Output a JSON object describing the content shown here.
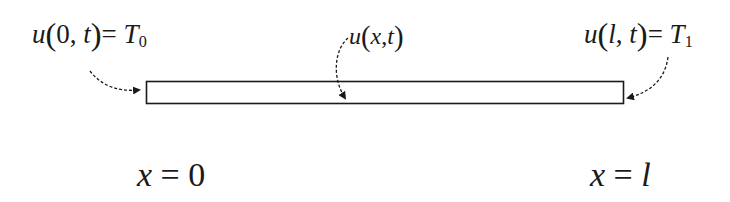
{
  "diagram": {
    "rod": {
      "x_start": 146,
      "x_end": 624,
      "y_top": 81,
      "y_bottom": 104,
      "stroke": "#1a1a1a"
    },
    "labels": {
      "left_boundary": {
        "func": "u",
        "arg1": "0",
        "arg2": "t",
        "equals": "=",
        "rhs": "T",
        "rhs_sub": "0"
      },
      "interior": {
        "func": "u",
        "arg1": "x",
        "arg2": "t"
      },
      "right_boundary": {
        "func": "u",
        "arg1": "l",
        "arg2": "t",
        "equals": "=",
        "rhs": "T",
        "rhs_sub": "1"
      }
    },
    "positions": {
      "left": {
        "var": "x",
        "equals": "=",
        "value": "0"
      },
      "right": {
        "var": "x",
        "equals": "=",
        "value": "l"
      }
    },
    "arrows": [
      {
        "name": "left-boundary-arrow",
        "target": "left end of rod",
        "style": "dashed-curved"
      },
      {
        "name": "interior-arrow",
        "target": "rod interior",
        "style": "dashed-curved"
      },
      {
        "name": "right-boundary-arrow",
        "target": "right end of rod",
        "style": "dashed-curved"
      }
    ]
  }
}
